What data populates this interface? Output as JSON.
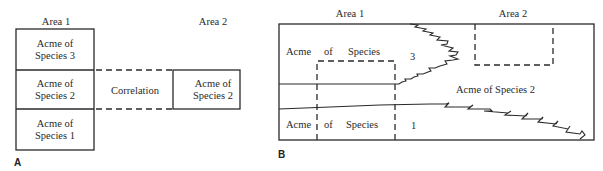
{
  "panel_a": {
    "label": "A",
    "area1_label": "Area 1",
    "area2_label": "Area 2",
    "column_area1": [
      {
        "line1": "Acme of",
        "line2": "Species 3"
      },
      {
        "line1": "Acme of",
        "line2": "Species 2"
      },
      {
        "line1": "Acme of",
        "line2": "Species 1"
      }
    ],
    "correlation_label": "Correlation",
    "area2_box": {
      "line1": "Acme of",
      "line2": "Species 2"
    }
  },
  "panel_b": {
    "label": "B",
    "area1_label": "Area 1",
    "area2_label": "Area 2",
    "upper_row": {
      "word1": "Acme",
      "word2": "of",
      "word3": "Species",
      "number": "3"
    },
    "lower_row": {
      "word1": "Acme",
      "word2": "of",
      "word3": "Species",
      "number": "1"
    },
    "middle_label": "Acme of Species 2"
  }
}
